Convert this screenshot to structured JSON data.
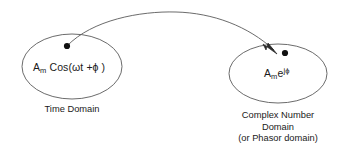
{
  "diagram": {
    "stroke_color": "#555555",
    "dot_color": "#111111",
    "text_color": "#1a1a1a",
    "background": "#ffffff",
    "left_group": {
      "formula": {
        "base": "A",
        "subscript": "m",
        "rest": " Cos(ωt +ϕ )"
      },
      "caption_lines": [
        "Time Domain"
      ]
    },
    "right_group": {
      "formula": {
        "base": "A",
        "subscript": "m",
        "mantissa": "e",
        "superscript": "jϕ"
      },
      "caption_lines": [
        "Complex Number",
        "Domain",
        "(or Phasor domain)"
      ]
    },
    "arrow": {
      "name": "phasor-transform-arrow",
      "from_point": [
        67,
        46
      ],
      "to_point": [
        276,
        52
      ],
      "apex": [
        176,
        12
      ],
      "direction": "left-to-right-curved"
    },
    "markers": {
      "left_dot": [
        67,
        46
      ],
      "right_dot": [
        285,
        53
      ]
    },
    "ellipses": {
      "left": {
        "cx": 72,
        "cy": 66.5,
        "rx": 50,
        "ry": 32.5
      },
      "right": {
        "cx": 278,
        "cy": 73.5,
        "rx": 49,
        "ry": 29.5
      }
    }
  }
}
